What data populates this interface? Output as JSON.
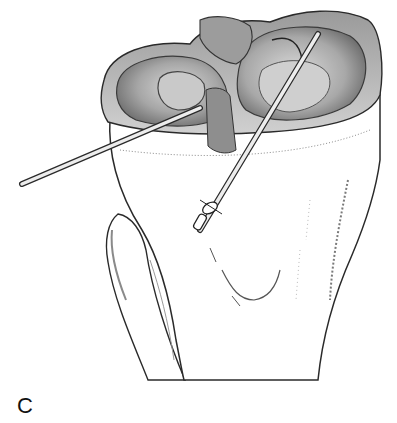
{
  "figure": {
    "panel_label": "C",
    "elements": [
      {
        "name": "tibia-proximal",
        "description": "Proximal tibia with plateau"
      },
      {
        "name": "fibula",
        "description": "Fibula on left side"
      },
      {
        "name": "medial-meniscus",
        "description": "Meniscus rim on plateau"
      },
      {
        "name": "lateral-meniscus",
        "description": "Meniscus rim on plateau"
      },
      {
        "name": "guide-pin-horizontal",
        "description": "Long pin entering from left"
      },
      {
        "name": "guide-pin-diagonal",
        "description": "Pin with drill sleeve entering anterior tibia"
      }
    ],
    "colors": {
      "background": "#ffffff",
      "ink": "#2a2a2a",
      "shade_dark": "#6e6e6e",
      "shade_mid": "#a8a8a8",
      "shade_light": "#d4d4d4"
    }
  }
}
